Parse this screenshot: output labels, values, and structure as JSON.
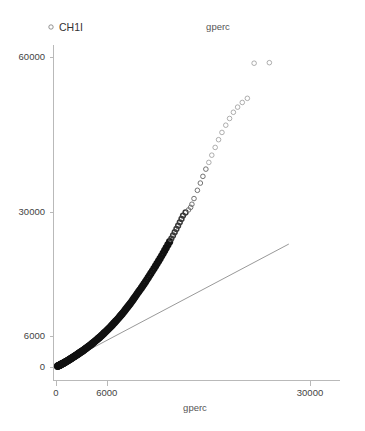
{
  "chart_data": {
    "type": "scatter",
    "title": "gperc",
    "xlabel": "gperc",
    "ylabel": "",
    "xlim": [
      0,
      33000
    ],
    "ylim": [
      -1500,
      66000
    ],
    "grid": false,
    "legend_position": "top-left",
    "legend": [
      {
        "name": "CH1I",
        "marker": "open-circle"
      }
    ],
    "xticks": [
      0,
      6000,
      30000
    ],
    "xtick_labels": [
      "0",
      "6000",
      "30000"
    ],
    "yticks": [
      0,
      6000,
      30000,
      60000
    ],
    "ytick_labels": [
      "0",
      "6000",
      "30000",
      "60000"
    ],
    "reference_line": {
      "name": "identity-reference-line",
      "x": [
        300,
        27500
      ],
      "y": [
        200,
        23800
      ]
    },
    "series": [
      {
        "name": "CH1I",
        "marker": "open-circle",
        "color": "#555555",
        "points": [
          [
            180,
            150
          ],
          [
            230,
            190
          ],
          [
            280,
            230
          ],
          [
            330,
            270
          ],
          [
            380,
            310
          ],
          [
            430,
            350
          ],
          [
            480,
            395
          ],
          [
            530,
            440
          ],
          [
            580,
            485
          ],
          [
            630,
            530
          ],
          [
            690,
            580
          ],
          [
            750,
            630
          ],
          [
            810,
            685
          ],
          [
            870,
            740
          ],
          [
            930,
            795
          ],
          [
            990,
            850
          ],
          [
            1050,
            910
          ],
          [
            1110,
            970
          ],
          [
            1170,
            1030
          ],
          [
            1230,
            1090
          ],
          [
            1300,
            1155
          ],
          [
            1370,
            1220
          ],
          [
            1440,
            1290
          ],
          [
            1510,
            1360
          ],
          [
            1580,
            1430
          ],
          [
            1650,
            1500
          ],
          [
            1720,
            1575
          ],
          [
            1790,
            1650
          ],
          [
            1860,
            1725
          ],
          [
            1930,
            1800
          ],
          [
            2000,
            1880
          ],
          [
            2080,
            1960
          ],
          [
            2160,
            2045
          ],
          [
            2240,
            2130
          ],
          [
            2320,
            2215
          ],
          [
            2400,
            2300
          ],
          [
            2480,
            2390
          ],
          [
            2560,
            2480
          ],
          [
            2640,
            2570
          ],
          [
            2720,
            2660
          ],
          [
            2810,
            2755
          ],
          [
            2900,
            2855
          ],
          [
            2990,
            2955
          ],
          [
            3080,
            3055
          ],
          [
            3170,
            3160
          ],
          [
            3260,
            3265
          ],
          [
            3350,
            3375
          ],
          [
            3440,
            3485
          ],
          [
            3530,
            3595
          ],
          [
            3620,
            3710
          ],
          [
            3720,
            3830
          ],
          [
            3820,
            3950
          ],
          [
            3920,
            4075
          ],
          [
            4020,
            4200
          ],
          [
            4120,
            4330
          ],
          [
            4220,
            4460
          ],
          [
            4320,
            4595
          ],
          [
            4420,
            4730
          ],
          [
            4520,
            4870
          ],
          [
            4620,
            5010
          ],
          [
            4730,
            5160
          ],
          [
            4840,
            5310
          ],
          [
            4950,
            5465
          ],
          [
            5060,
            5620
          ],
          [
            5170,
            5780
          ],
          [
            5280,
            5945
          ],
          [
            5390,
            6110
          ],
          [
            5500,
            6280
          ],
          [
            5610,
            6455
          ],
          [
            5720,
            6630
          ],
          [
            5840,
            6815
          ],
          [
            5960,
            7000
          ],
          [
            6080,
            7190
          ],
          [
            6200,
            7385
          ],
          [
            6320,
            7580
          ],
          [
            6440,
            7785
          ],
          [
            6560,
            7990
          ],
          [
            6680,
            8200
          ],
          [
            6800,
            8415
          ],
          [
            6920,
            8630
          ],
          [
            7050,
            8860
          ],
          [
            7180,
            9090
          ],
          [
            7310,
            9330
          ],
          [
            7440,
            9570
          ],
          [
            7570,
            9820
          ],
          [
            7700,
            10070
          ],
          [
            7830,
            10330
          ],
          [
            7960,
            10590
          ],
          [
            8090,
            10860
          ],
          [
            8220,
            11130
          ],
          [
            8360,
            11420
          ],
          [
            8500,
            11710
          ],
          [
            8640,
            12010
          ],
          [
            8780,
            12310
          ],
          [
            8920,
            12620
          ],
          [
            9060,
            12935
          ],
          [
            9200,
            13260
          ],
          [
            9340,
            13585
          ],
          [
            9480,
            13920
          ],
          [
            9620,
            14260
          ],
          [
            9780,
            14620
          ],
          [
            9940,
            14985
          ],
          [
            10100,
            15360
          ],
          [
            10260,
            15740
          ],
          [
            10420,
            16130
          ],
          [
            10580,
            16520
          ],
          [
            10740,
            16925
          ],
          [
            10900,
            17330
          ],
          [
            11060,
            17745
          ],
          [
            11220,
            18165
          ],
          [
            11400,
            18620
          ],
          [
            11580,
            19080
          ],
          [
            11760,
            19550
          ],
          [
            11940,
            20030
          ],
          [
            12120,
            20520
          ],
          [
            12300,
            21015
          ],
          [
            12480,
            21520
          ],
          [
            12660,
            22030
          ],
          [
            12840,
            22550
          ],
          [
            13020,
            23080
          ],
          [
            13220,
            23660
          ],
          [
            13420,
            24250
          ],
          [
            13620,
            24850
          ],
          [
            13820,
            25460
          ],
          [
            14020,
            26080
          ],
          [
            14220,
            26710
          ],
          [
            14420,
            27350
          ],
          [
            14620,
            28000
          ],
          [
            14820,
            28660
          ],
          [
            15000,
            29300
          ],
          [
            15300,
            29900
          ],
          [
            15650,
            30400
          ],
          [
            15900,
            30900
          ],
          [
            16050,
            31500
          ],
          [
            16300,
            32600
          ],
          [
            16700,
            34200
          ],
          [
            17050,
            35600
          ],
          [
            17350,
            36900
          ],
          [
            17700,
            38300
          ],
          [
            18050,
            39600
          ],
          [
            18400,
            41000
          ],
          [
            18800,
            42500
          ],
          [
            19200,
            44000
          ],
          [
            19600,
            45400
          ],
          [
            20050,
            46800
          ],
          [
            20500,
            48100
          ],
          [
            20950,
            49300
          ],
          [
            21450,
            50300
          ],
          [
            22000,
            51200
          ],
          [
            22600,
            52000
          ],
          [
            23400,
            58800
          ],
          [
            25200,
            58900
          ]
        ]
      }
    ]
  }
}
